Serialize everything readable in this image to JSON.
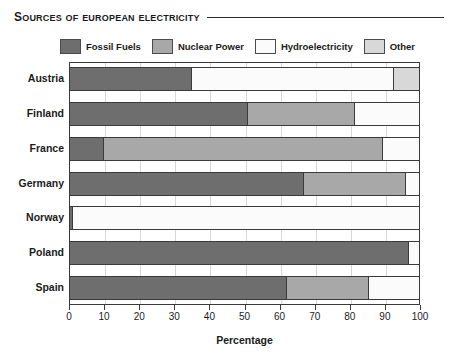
{
  "title": {
    "text": "Sources of European Electricity"
  },
  "legend": {
    "items": [
      {
        "label": "Fossil Fuels",
        "key": "fossil",
        "color": "#6e6e6e"
      },
      {
        "label": "Nuclear Power",
        "key": "nuclear",
        "color": "#a8a8a8"
      },
      {
        "label": "Hydroelectricity",
        "key": "hydro",
        "color": "#fbfbfb"
      },
      {
        "label": "Other",
        "key": "other",
        "color": "#d8d8d8"
      }
    ]
  },
  "axis": {
    "x_title": "Percentage",
    "ticks": [
      0,
      10,
      20,
      30,
      40,
      50,
      60,
      70,
      80,
      90,
      100
    ]
  },
  "chart_data": {
    "type": "bar",
    "orientation": "horizontal",
    "stacked": true,
    "title": "Sources of European Electricity",
    "xlabel": "Percentage",
    "ylabel": "",
    "xlim": [
      0,
      100
    ],
    "xticks": [
      0,
      10,
      20,
      30,
      40,
      50,
      60,
      70,
      80,
      90,
      100
    ],
    "grid": true,
    "legend_position": "top",
    "categories": [
      "Austria",
      "Finland",
      "France",
      "Germany",
      "Norway",
      "Poland",
      "Spain"
    ],
    "series": [
      {
        "name": "Fossil Fuels",
        "color": "#6e6e6e",
        "values": [
          35,
          51,
          10,
          67,
          1,
          97,
          62
        ]
      },
      {
        "name": "Nuclear Power",
        "color": "#a8a8a8",
        "values": [
          0,
          30.5,
          79.5,
          29,
          0,
          0,
          23.5
        ]
      },
      {
        "name": "Hydroelectricity",
        "color": "#fbfbfb",
        "values": [
          57.5,
          18.5,
          10.5,
          4,
          99,
          3,
          14.5
        ]
      },
      {
        "name": "Other",
        "color": "#d8d8d8",
        "values": [
          7.5,
          0,
          0,
          0,
          0,
          0,
          0
        ]
      }
    ]
  }
}
